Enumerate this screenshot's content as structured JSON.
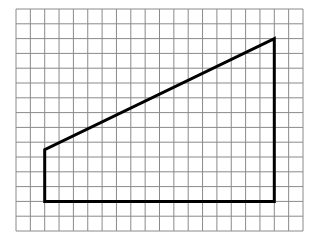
{
  "diagram": {
    "type": "trapezoid-on-grid",
    "grid": {
      "cols": 20,
      "rows": 15,
      "left": 16,
      "top": 9,
      "right": 303,
      "bottom": 231,
      "line_color": "#8a8a8a"
    },
    "shape": {
      "stroke": "#000000",
      "vertices_grid": [
        [
          2,
          9.5
        ],
        [
          2,
          13
        ],
        [
          18,
          13
        ],
        [
          18,
          2
        ]
      ],
      "description": "Right trapezoid with vertical left and right sides, horizontal bottom, slanted top"
    }
  }
}
